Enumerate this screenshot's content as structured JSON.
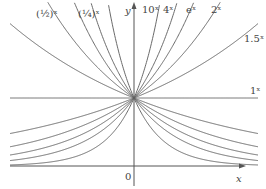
{
  "chart_data": {
    "type": "line",
    "title": "",
    "xlabel": "x",
    "ylabel": "y",
    "origin_label": "0",
    "grid": false,
    "legend_position": "inline labels at curve ends",
    "xlim": [
      -1.85,
      1.7
    ],
    "ylim": [
      0,
      2.45
    ],
    "series": [
      {
        "name": "(1/2)^x",
        "base": 0.5,
        "label_display": "(½)ˣ"
      },
      {
        "name": "(1/4)^x",
        "base": 0.25,
        "label_display": "(¼)ˣ"
      },
      {
        "name": "10^x",
        "base": 10,
        "label_display": "10ˣ"
      },
      {
        "name": "4^x",
        "base": 4,
        "label_display": "4ˣ"
      },
      {
        "name": "e^x",
        "base": 2.718281828,
        "label_display": "eˣ"
      },
      {
        "name": "2^x",
        "base": 2,
        "label_display": "2ˣ"
      },
      {
        "name": "1.5^x",
        "base": 1.5,
        "label_display": "1.5ˣ"
      },
      {
        "name": "1^x",
        "base": 1,
        "label_display": "1ˣ"
      }
    ],
    "mirror_curves_left_side": [
      {
        "name": "(1/10)^x reflection",
        "base": 0.1
      },
      {
        "name": "(1/e)^x reflection",
        "base": 0.367879441
      },
      {
        "name": "(1/1.5)^x reflection",
        "base": 0.666666667
      }
    ],
    "common_point": {
      "x": 0,
      "y": 1
    },
    "annotations": [
      "All curves pass through (0, 1)"
    ]
  },
  "layout": {
    "origin_px": [
      134,
      166
    ],
    "unit_px": 68,
    "plot_left_px": 10,
    "plot_right_px": 258,
    "plot_top_px": 2,
    "axis_color": "#555555",
    "curve_color": "#6a6a6a"
  },
  "labels": {
    "y_axis": "y",
    "x_axis": "x",
    "origin": "0",
    "half": "(½)ˣ",
    "quarter": "(¼)ˣ",
    "ten": "10ˣ",
    "four": "4ˣ",
    "e": "eˣ",
    "two": "2ˣ",
    "one_five": "1.5ˣ",
    "one": "1ˣ"
  }
}
